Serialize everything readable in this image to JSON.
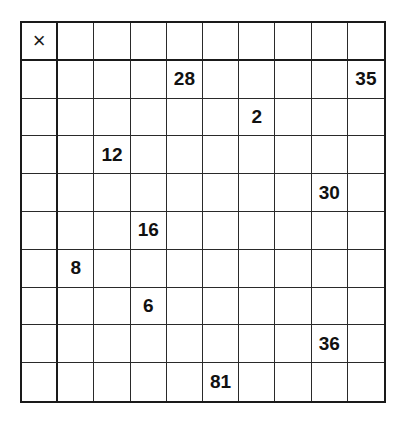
{
  "worksheet": {
    "operator_symbol": "×",
    "size": 10,
    "rows": [
      [
        "×",
        "",
        "",
        "",
        "",
        "",
        "",
        "",
        "",
        ""
      ],
      [
        "",
        "",
        "",
        "",
        "28",
        "",
        "",
        "",
        "",
        "35"
      ],
      [
        "",
        "",
        "",
        "",
        "",
        "",
        "2",
        "",
        "",
        ""
      ],
      [
        "",
        "",
        "12",
        "",
        "",
        "",
        "",
        "",
        "",
        ""
      ],
      [
        "",
        "",
        "",
        "",
        "",
        "",
        "",
        "",
        "30",
        ""
      ],
      [
        "",
        "",
        "",
        "16",
        "",
        "",
        "",
        "",
        "",
        ""
      ],
      [
        "",
        "8",
        "",
        "",
        "",
        "",
        "",
        "",
        "",
        ""
      ],
      [
        "",
        "",
        "",
        "6",
        "",
        "",
        "",
        "",
        "",
        ""
      ],
      [
        "",
        "",
        "",
        "",
        "",
        "",
        "",
        "",
        "36",
        ""
      ],
      [
        "",
        "",
        "",
        "",
        "",
        "81",
        "",
        "",
        "",
        ""
      ]
    ]
  }
}
